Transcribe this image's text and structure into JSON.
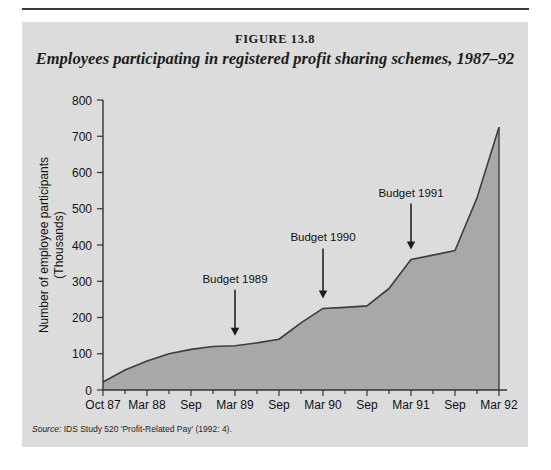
{
  "figure": {
    "number_label": "FIGURE 13.8",
    "title": "Employees participating in registered profit sharing schemes, 1987–92",
    "source_label": "Source:",
    "source_text": " IDS Study 520 'Profit-Related Pay' (1992: 4).",
    "panel_background": "#dcdcdc",
    "area_fill": "#a8a8a8",
    "line_color": "#3d3d3d"
  },
  "chart_data": {
    "type": "area",
    "title": "Employees participating in registered profit sharing schemes, 1987–92",
    "xlabel": "",
    "ylabel": "Number of employee participants (Thousands)",
    "ylabel_lines": [
      "Number of employee participants",
      "(Thousands)"
    ],
    "ylim": [
      0,
      800
    ],
    "yticks": [
      0,
      100,
      200,
      300,
      400,
      500,
      600,
      700,
      800
    ],
    "ytick_labels": [
      "0",
      "100",
      "200",
      "300",
      "400",
      "500",
      "600",
      "700",
      "800"
    ],
    "grid": false,
    "legend": false,
    "x_major_labels": [
      "Oct 87",
      "Mar 88",
      "Sep",
      "Mar 89",
      "Sep",
      "Mar 90",
      "Sep",
      "Mar 91",
      "Sep",
      "Mar 92"
    ],
    "x_minor_ticks_between_majors": 1,
    "x": [
      "Oct 87",
      "Jan 88",
      "Mar 88",
      "Jun 88",
      "Sep 88",
      "Dec 88",
      "Mar 89",
      "Jun 89",
      "Sep 89",
      "Dec 89",
      "Mar 90",
      "Jun 90",
      "Sep 90",
      "Dec 90",
      "Mar 91",
      "Jun 91",
      "Sep 91",
      "Dec 91",
      "Mar 92"
    ],
    "values": [
      22,
      55,
      80,
      100,
      112,
      120,
      122,
      130,
      140,
      185,
      225,
      228,
      232,
      280,
      360,
      372,
      385,
      530,
      725
    ],
    "annotations": [
      {
        "text": "Budget 1989",
        "x_category": "Mar 89",
        "point_value": 122,
        "arrow": "down"
      },
      {
        "text": "Budget 1990",
        "x_category": "Mar 90",
        "point_value": 225,
        "arrow": "down"
      },
      {
        "text": "Budget 1991",
        "x_category": "Mar 91",
        "point_value": 360,
        "arrow": "down"
      }
    ]
  }
}
